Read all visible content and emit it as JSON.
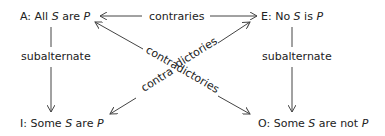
{
  "diagram": {
    "nodes": {
      "A": {
        "prefix": "A: All ",
        "subject": "S",
        "middle": " are ",
        "predicate": "P",
        "suffix": ""
      },
      "E": {
        "prefix": "E: No ",
        "subject": "S",
        "middle": " is ",
        "predicate": "P",
        "suffix": ""
      },
      "I": {
        "prefix": "I: Some ",
        "subject": "S",
        "middle": " are ",
        "predicate": "P",
        "suffix": ""
      },
      "O": {
        "prefix": "O: Some ",
        "subject": "S",
        "middle": " are not ",
        "predicate": "P",
        "suffix": ""
      }
    },
    "relations": {
      "contraries": "contraries",
      "subalternate_left": "subalternate",
      "subalternate_right": "subalternate",
      "contradictories_1a": "contra",
      "contradictories_1b": "dictories",
      "contradictories_2": "contradictories"
    },
    "edges": [
      {
        "from": "contraries",
        "to": "A",
        "label": "contraries"
      },
      {
        "from": "contraries",
        "to": "E",
        "label": "contraries"
      },
      {
        "from": "A",
        "to": "I",
        "label": "subalternate"
      },
      {
        "from": "E",
        "to": "O",
        "label": "subalternate"
      },
      {
        "from": "A",
        "to": "O",
        "label": "contradictories"
      },
      {
        "from": "E",
        "to": "I",
        "label": "contradictories"
      }
    ]
  }
}
